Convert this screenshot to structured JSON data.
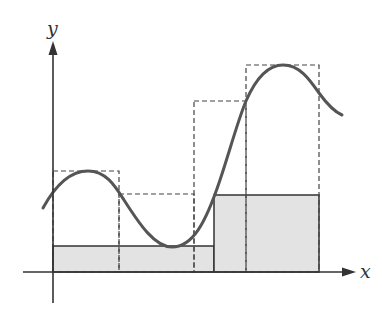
{
  "diagram": {
    "axes": {
      "x_label": "x",
      "y_label": "y",
      "origin_px": [
        53,
        272
      ]
    },
    "partition_px": [
      53,
      119,
      194,
      246,
      319
    ],
    "upper_rectangles": [
      {
        "x0": 53,
        "x1": 119,
        "top": 171
      },
      {
        "x0": 119,
        "x1": 194,
        "top": 194
      },
      {
        "x0": 194,
        "x1": 246,
        "top": 101
      },
      {
        "x0": 246,
        "x1": 319,
        "top": 65
      }
    ],
    "lower_rectangles": [
      {
        "x0": 53,
        "x1": 214,
        "top": 246
      },
      {
        "x0": 214,
        "x1": 319,
        "top": 195
      }
    ],
    "colors": {
      "curve": "#555555",
      "axis": "#333333",
      "dashed": "#444444",
      "fill": "#e3e3e3",
      "fill_stroke": "#333333"
    }
  }
}
